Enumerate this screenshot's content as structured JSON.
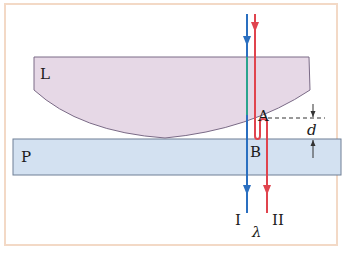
{
  "figure": {
    "labels": {
      "lens": "L",
      "plate": "P",
      "point_a": "A",
      "point_b": "B",
      "gap": "d",
      "ray_1": "I",
      "ray_2": "II",
      "wavelength": "λ"
    },
    "colors": {
      "frame_border": "#f3d9c6",
      "lens_fill": "#e6d8e6",
      "lens_stroke": "#7a6a86",
      "plate_fill": "#d3e1f1",
      "plate_stroke": "#6f7f95",
      "ray_1": "#2a6fc0",
      "ray_2": "#e0444e",
      "ray_1_inside_lens": "#2aa38e"
    }
  }
}
